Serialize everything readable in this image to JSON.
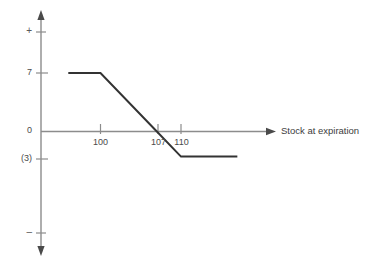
{
  "chart_data": {
    "type": "line",
    "title": "",
    "xlabel": "Stock at expiration",
    "ylabel": "",
    "grid": false,
    "legend": false,
    "xlim": [
      92,
      130
    ],
    "ylim": [
      -12,
      14
    ],
    "x_ticks": [
      100,
      107,
      110
    ],
    "x_tick_labels": [
      "100",
      "107",
      "110"
    ],
    "y_ticks": [
      7,
      0,
      -3
    ],
    "y_tick_labels": [
      "7",
      "0",
      "(3)"
    ],
    "axis_sign_labels": {
      "positive": "+",
      "negative": "–"
    },
    "series": [
      {
        "name": "Payoff at expiration",
        "x": [
          96,
          100,
          107,
          110,
          117
        ],
        "values": [
          7,
          7,
          0,
          -3,
          -3
        ]
      }
    ],
    "annotations": {
      "max_profit": 7,
      "breakeven": 107,
      "max_loss": -3,
      "lower_strike": 100,
      "upper_strike": 110
    }
  },
  "axes": {
    "x_axis_arrow": "arrow-right",
    "y_axis_arrow_up": "arrow-up",
    "y_axis_arrow_down": "arrow-down",
    "x_axis_title": "Stock at expiration"
  },
  "colors": {
    "axis": "#8c8c8c",
    "payoff_line": "#333333",
    "tick_label": "#4a4a4a",
    "background": "#ffffff"
  }
}
